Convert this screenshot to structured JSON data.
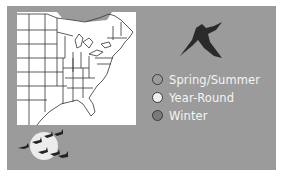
{
  "map": {
    "region": "Eastern United States",
    "background": "#ffffff",
    "shaded_region_color": "#9b9b9b"
  },
  "panel": {
    "background": "#9b9b9b"
  },
  "icons": {
    "bird": "flying-shorebird-silhouette",
    "flock": "flock-of-birds-over-moon"
  },
  "legend": {
    "items": [
      {
        "label": "Spring/Summer",
        "color": "#9b9b9b"
      },
      {
        "label": "Year-Round",
        "color": "#f0f0f0"
      },
      {
        "label": "Winter",
        "color": "#7a7a7a"
      }
    ]
  }
}
